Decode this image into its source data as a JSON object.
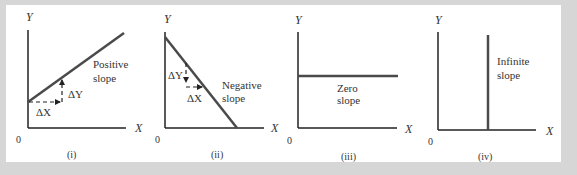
{
  "figure": {
    "background": "#d6d6d6",
    "panel_background": "#ffffff",
    "axis_color": "#222222",
    "line_color": "#4a4a4a",
    "panels": [
      {
        "id": "i",
        "caption": "(i)",
        "y_axis_label": "Y",
        "x_axis_label": "X",
        "origin_label": "0",
        "line_label_1": "Positive",
        "line_label_2": "slope",
        "delta_y_label": "ΔY",
        "delta_x_label": "ΔX"
      },
      {
        "id": "ii",
        "caption": "(ii)",
        "y_axis_label": "Y",
        "x_axis_label": "X",
        "origin_label": "0",
        "line_label_1": "Negative",
        "line_label_2": "slope",
        "delta_y_label": "ΔY",
        "delta_x_label": "ΔX"
      },
      {
        "id": "iii",
        "caption": "(iii)",
        "y_axis_label": "Y",
        "x_axis_label": "X",
        "origin_label": "0",
        "line_label_1": "Zero",
        "line_label_2": "slope"
      },
      {
        "id": "iv",
        "caption": "(iv)",
        "y_axis_label": "Y",
        "x_axis_label": "X",
        "origin_label": "0",
        "line_label_1": "Infinite",
        "line_label_2": "slope"
      }
    ]
  }
}
